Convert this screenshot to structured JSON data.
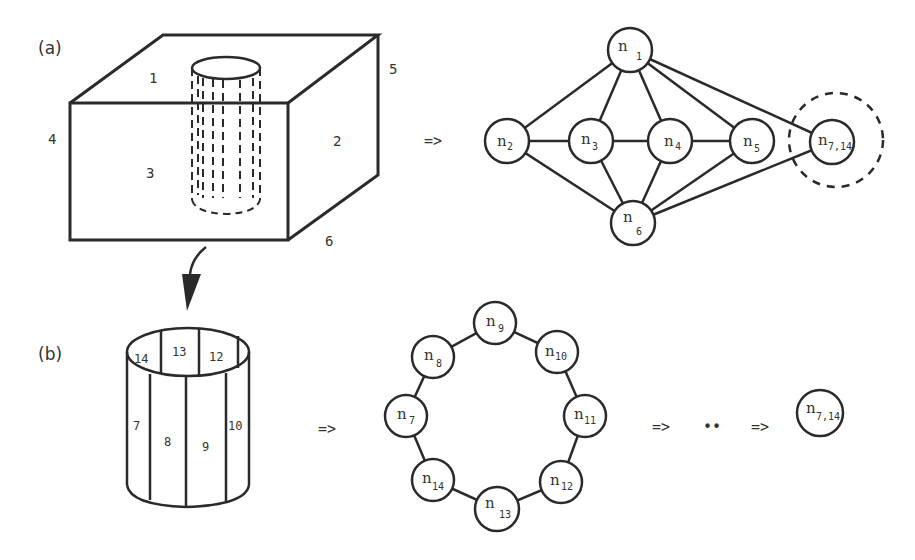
{
  "panels": {
    "a": {
      "label": "(a)",
      "box_faces": [
        "1",
        "2",
        "3",
        "4",
        "5",
        "6"
      ],
      "arrow": "=>",
      "graph": {
        "nodes": [
          {
            "id": "n1",
            "base": "n",
            "sub": "1",
            "x": 630,
            "y": 50
          },
          {
            "id": "n2",
            "base": "n",
            "sub": "2",
            "x": 507,
            "y": 141
          },
          {
            "id": "n3",
            "base": "n",
            "sub": "3",
            "x": 591,
            "y": 141
          },
          {
            "id": "n4",
            "base": "n",
            "sub": "4",
            "x": 670,
            "y": 141
          },
          {
            "id": "n5",
            "base": "n",
            "sub": "5",
            "x": 752,
            "y": 141
          },
          {
            "id": "n6",
            "base": "n",
            "sub": "6",
            "x": 633,
            "y": 223
          },
          {
            "id": "n7_14",
            "base": "n",
            "sub": "7,14",
            "x": 832,
            "y": 142
          }
        ],
        "edges": [
          [
            "n1",
            "n2"
          ],
          [
            "n1",
            "n3"
          ],
          [
            "n1",
            "n4"
          ],
          [
            "n1",
            "n5"
          ],
          [
            "n1",
            "n7_14"
          ],
          [
            "n2",
            "n3"
          ],
          [
            "n3",
            "n4"
          ],
          [
            "n4",
            "n5"
          ],
          [
            "n2",
            "n6"
          ],
          [
            "n3",
            "n6"
          ],
          [
            "n4",
            "n6"
          ],
          [
            "n5",
            "n6"
          ],
          [
            "n7_14",
            "n6"
          ]
        ],
        "highlight": "n7_14"
      }
    },
    "b": {
      "label": "(b)",
      "cylinder_faces": [
        "7",
        "8",
        "9",
        "10",
        "12",
        "13",
        "14"
      ],
      "arrow": "=>",
      "ring": {
        "nodes": [
          {
            "id": "n9",
            "base": "n",
            "sub": "9",
            "x": 495,
            "y": 323
          },
          {
            "id": "n10",
            "base": "n",
            "sub": "10",
            "x": 557,
            "y": 352
          },
          {
            "id": "n11",
            "base": "n",
            "sub": "11",
            "x": 585,
            "y": 416
          },
          {
            "id": "n12",
            "base": "n",
            "sub": "12",
            "x": 561,
            "y": 482
          },
          {
            "id": "n13",
            "base": "n",
            "sub": "13",
            "x": 497,
            "y": 509
          },
          {
            "id": "n14",
            "base": "n",
            "sub": "14",
            "x": 433,
            "y": 480
          },
          {
            "id": "n7",
            "base": "n",
            "sub": "7",
            "x": 406,
            "y": 416
          },
          {
            "id": "n8",
            "base": "n",
            "sub": "8",
            "x": 433,
            "y": 357
          }
        ]
      },
      "sequence": {
        "arrow1": "=>",
        "ellipsis": "••",
        "arrow2": "=>",
        "final_node": {
          "base": "n",
          "sub": "7,14"
        }
      }
    }
  }
}
